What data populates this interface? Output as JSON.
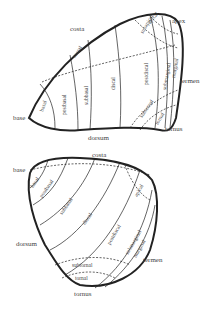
{
  "forewing": {
    "margins": {
      "costa": "costa",
      "apex": "apex",
      "termen": "termen",
      "tornus": "tornus",
      "dorsum": "dorsum",
      "base": "base"
    },
    "zones": {
      "basal": "basal",
      "postbasal": "postbasal",
      "subbasal": "subbasal",
      "discal": "discal",
      "postdiscal": "postdiscal",
      "subapical": "subapical",
      "apical": "apical",
      "submarginal": "submarginal",
      "marginal": "marginal",
      "subtornal": "subtornal",
      "tornal": "tornal",
      "costal": "costal"
    }
  },
  "hindwing": {
    "margins": {
      "costa": "costa",
      "base": "base",
      "dorsum": "dorsum",
      "termen": "termen",
      "tornus": "tornus"
    },
    "zones": {
      "basal": "basal",
      "postbasal": "postbasal",
      "subbasal": "subbasal",
      "discal": "discal",
      "postdiscal": "postdiscal",
      "apical": "apical",
      "submarginal": "submarginal",
      "marginal": "marginal",
      "subtornal": "subtornal",
      "tornal": "tornal"
    }
  }
}
